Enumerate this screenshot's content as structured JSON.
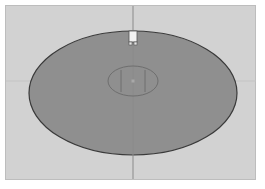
{
  "viewport": {
    "name": "top-view",
    "background": "#d2d2d2",
    "grid_axis_color": "#a9a9a9"
  },
  "object": {
    "type": "ellipse-disc",
    "fill": "#8f8f8f",
    "stroke": "#3a3a3a",
    "center": [
      133,
      93
    ],
    "radii": [
      104,
      62
    ]
  },
  "pivot_gizmo": {
    "type": "inner-ellipse-with-handles",
    "stroke": "#6e6e6e",
    "center": [
      133,
      81
    ],
    "radii": [
      25,
      15
    ]
  },
  "top_handle": {
    "type": "selection-marker",
    "fill": "#f2f2f2",
    "stroke": "#555555"
  }
}
